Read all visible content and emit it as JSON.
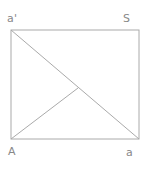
{
  "figure": {
    "type": "geometry-diagram",
    "colors": {
      "line": "#aaaaaa",
      "label": "#888888",
      "background": "#ffffff"
    },
    "canvas": {
      "width": 149,
      "height": 170
    },
    "rectangle": {
      "top_left": {
        "x": 11,
        "y": 30
      },
      "top_right": {
        "x": 139,
        "y": 30
      },
      "bottom_right": {
        "x": 139,
        "y": 139
      },
      "bottom_left": {
        "x": 11,
        "y": 139
      }
    },
    "segments": [
      {
        "name": "top-edge",
        "from": {
          "x": 11,
          "y": 30
        },
        "to": {
          "x": 139,
          "y": 30
        }
      },
      {
        "name": "right-edge",
        "from": {
          "x": 139,
          "y": 30
        },
        "to": {
          "x": 139,
          "y": 139
        }
      },
      {
        "name": "bottom-edge",
        "from": {
          "x": 139,
          "y": 139
        },
        "to": {
          "x": 11,
          "y": 139
        }
      },
      {
        "name": "left-edge",
        "from": {
          "x": 11,
          "y": 139
        },
        "to": {
          "x": 11,
          "y": 30
        }
      },
      {
        "name": "main-diagonal",
        "from": {
          "x": 11,
          "y": 30
        },
        "to": {
          "x": 139,
          "y": 139
        }
      },
      {
        "name": "corner-to-vertex",
        "from": {
          "x": 11,
          "y": 139
        },
        "to": {
          "x": 78,
          "y": 88
        }
      }
    ],
    "interior_vertex": {
      "x": 78,
      "y": 88
    },
    "labels": {
      "top_left": "a'",
      "top_right": "S",
      "bottom_left": "A",
      "bottom_right": "a"
    }
  }
}
